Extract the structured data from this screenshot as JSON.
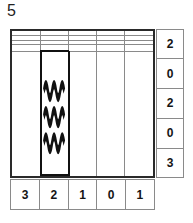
{
  "puzzle": {
    "number_label": "5",
    "grid": {
      "rows": 5,
      "cols": 5
    },
    "row_clues": [
      "2",
      "0",
      "2",
      "0",
      "3"
    ],
    "col_clues": [
      "3",
      "2",
      "1",
      "0",
      "1"
    ],
    "special_cells": [
      {
        "row": 4,
        "col": 1,
        "symbol": "water-waves-icon",
        "wave_count": 3
      }
    ],
    "colors": {
      "outer_border": "#2a2a2a",
      "inner_grid_line": "#8a8a8a",
      "special_cell_border": "#111111",
      "wave_stroke": "#111111",
      "text": "#141414",
      "background": "#ffffff"
    }
  }
}
